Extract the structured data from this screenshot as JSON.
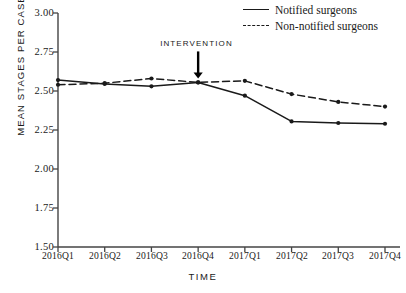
{
  "chart_data": {
    "type": "line",
    "title": "",
    "xlabel": "TIME",
    "ylabel": "MEAN STAGES PER CASE",
    "categories": [
      "2016Q1",
      "2016Q2",
      "2016Q3",
      "2016Q4",
      "2017Q1",
      "2017Q2",
      "2017Q3",
      "2017Q4"
    ],
    "ylim": [
      1.5,
      3.0
    ],
    "yticks": [
      "3.00",
      "2.75",
      "2.50",
      "2.25",
      "2.00",
      "1.75",
      "1.50"
    ],
    "ytick_values": [
      3.0,
      2.75,
      2.5,
      2.25,
      2.0,
      1.75,
      1.5
    ],
    "grid": false,
    "legend_position": "top-right",
    "series": [
      {
        "name": "Notified surgeons",
        "style": "solid",
        "color": "#1a1a1a",
        "values": [
          2.57,
          2.545,
          2.53,
          2.555,
          2.47,
          2.305,
          2.295,
          2.29
        ]
      },
      {
        "name": "Non-notified surgeons",
        "style": "dashed",
        "color": "#1a1a1a",
        "values": [
          2.54,
          2.55,
          2.58,
          2.555,
          2.565,
          2.48,
          2.43,
          2.4
        ]
      }
    ],
    "annotations": [
      {
        "text": "INTERVENTION",
        "at_category": "2016Q4",
        "at_value": 2.555,
        "marker": "down-arrow"
      }
    ]
  }
}
